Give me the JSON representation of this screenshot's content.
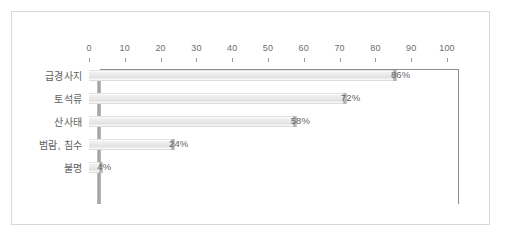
{
  "chart_data": {
    "type": "bar",
    "orientation": "horizontal",
    "title": "",
    "subtitle": "",
    "xlabel": "",
    "ylabel": "",
    "xlim": [
      0,
      100
    ],
    "xticks": [
      "0",
      "10",
      "20",
      "30",
      "40",
      "50",
      "60",
      "70",
      "80",
      "90",
      "100"
    ],
    "xtick_values": [
      0,
      10,
      20,
      30,
      40,
      50,
      60,
      70,
      80,
      90,
      100
    ],
    "grid": false,
    "legend": null,
    "axis_position": "top",
    "categories": [
      "급경사지",
      "토석류",
      "산사태",
      "범람, 침수",
      "불명"
    ],
    "values": [
      86,
      72,
      58,
      24,
      4
    ],
    "data_labels": [
      "86%",
      "72%",
      "58%",
      "24%",
      "4%"
    ],
    "colors": {
      "bar_fill": "#e9e9e9",
      "bar_cap": "#adadad",
      "axis_line": "#8e8e8e",
      "axis_band": "#9d9d9d",
      "tick_label": "#6e6e6e",
      "category_label": "#5e5e5e",
      "value_label": "#666666",
      "frame_border": "#d9d9d9",
      "background": "#ffffff"
    }
  }
}
